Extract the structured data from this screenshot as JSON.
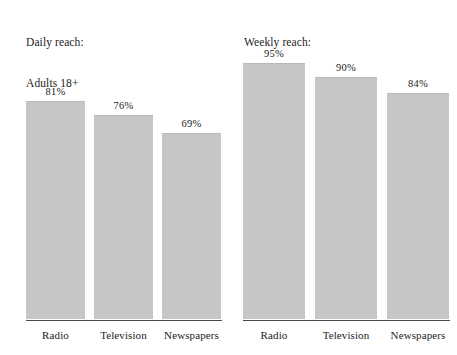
{
  "chart_data": [
    {
      "type": "bar",
      "title": "Daily reach:\nAdults 18+",
      "title_lines": [
        "Daily reach:",
        "Adults 18+"
      ],
      "categories": [
        "Radio",
        "Television",
        "Newspapers"
      ],
      "values": [
        81,
        76,
        69
      ],
      "value_labels": [
        "81%",
        "76%",
        "69%"
      ],
      "xlabel": "",
      "ylabel": "",
      "ylim": [
        0,
        100
      ],
      "grid": false,
      "legend": false,
      "bar_color": "#c6c6c6",
      "axis_color": "#4a4a4a"
    },
    {
      "type": "bar",
      "title": "Weekly reach:\nAdults 18+",
      "title_lines": [
        "Weekly reach:",
        "Adults 18+"
      ],
      "categories": [
        "Radio",
        "Television",
        "Newspapers"
      ],
      "values": [
        95,
        90,
        84
      ],
      "value_labels": [
        "95%",
        "90%",
        "84%"
      ],
      "xlabel": "",
      "ylabel": "",
      "ylim": [
        0,
        100
      ],
      "grid": false,
      "legend": false,
      "bar_color": "#c6c6c6",
      "axis_color": "#4a4a4a"
    }
  ]
}
